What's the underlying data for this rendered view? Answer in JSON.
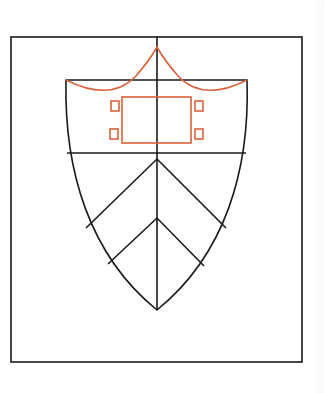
{
  "diagram": {
    "colors": {
      "outline": "#1a1a1a",
      "accent": "#d9623a",
      "background": "#ffffff"
    },
    "frame": {
      "x": 11,
      "y": 37,
      "w": 291,
      "h": 325
    },
    "shield": {
      "top_y": 80,
      "left_x": 66,
      "right_x": 247,
      "center_x": 157,
      "divider_y": 153,
      "tip_y": 310
    },
    "chevrons": [
      {
        "apex": [
          157,
          159
        ],
        "left": [
          86,
          228
        ],
        "right": [
          226,
          228
        ]
      },
      {
        "apex": [
          157,
          218
        ],
        "left": [
          108,
          264
        ],
        "right": [
          204,
          266
        ]
      }
    ],
    "crown_peak": [
      157,
      47
    ],
    "center_rect": {
      "x": 122,
      "y": 97,
      "w": 69,
      "h": 46
    },
    "small_squares": [
      {
        "x": 111,
        "y": 101,
        "w": 8,
        "h": 10
      },
      {
        "x": 110,
        "y": 129,
        "w": 8,
        "h": 10
      },
      {
        "x": 195,
        "y": 101,
        "w": 8,
        "h": 10
      },
      {
        "x": 195,
        "y": 129,
        "w": 8,
        "h": 10
      }
    ]
  }
}
